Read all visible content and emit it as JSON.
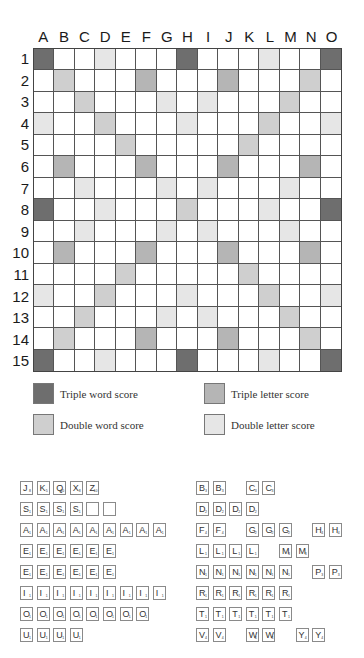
{
  "board": {
    "columns": [
      "A",
      "B",
      "C",
      "D",
      "E",
      "F",
      "G",
      "H",
      "I",
      "J",
      "K",
      "L",
      "M",
      "N",
      "O"
    ],
    "rows": [
      "1",
      "2",
      "3",
      "4",
      "5",
      "6",
      "7",
      "8",
      "9",
      "10",
      "11",
      "12",
      "13",
      "14",
      "15"
    ],
    "layout": [
      [
        "TW",
        "",
        "",
        "DL",
        "",
        "",
        "",
        "TW",
        "",
        "",
        "",
        "DL",
        "",
        "",
        "TW"
      ],
      [
        "",
        "DW",
        "",
        "",
        "",
        "TL",
        "",
        "",
        "",
        "TL",
        "",
        "",
        "",
        "DW",
        ""
      ],
      [
        "",
        "",
        "DW",
        "",
        "",
        "",
        "DL",
        "",
        "DL",
        "",
        "",
        "",
        "DW",
        "",
        ""
      ],
      [
        "DL",
        "",
        "",
        "DW",
        "",
        "",
        "",
        "DL",
        "",
        "",
        "",
        "DW",
        "",
        "",
        "DL"
      ],
      [
        "",
        "",
        "",
        "",
        "DW",
        "",
        "",
        "",
        "",
        "",
        "DW",
        "",
        "",
        "",
        ""
      ],
      [
        "",
        "TL",
        "",
        "",
        "",
        "TL",
        "",
        "",
        "",
        "TL",
        "",
        "",
        "",
        "TL",
        ""
      ],
      [
        "",
        "",
        "DL",
        "",
        "",
        "",
        "DL",
        "",
        "DL",
        "",
        "",
        "",
        "DL",
        "",
        ""
      ],
      [
        "TW",
        "",
        "",
        "DL",
        "",
        "",
        "",
        "DW",
        "",
        "",
        "",
        "DL",
        "",
        "",
        "TW"
      ],
      [
        "",
        "",
        "DL",
        "",
        "",
        "",
        "DL",
        "",
        "DL",
        "",
        "",
        "",
        "DL",
        "",
        ""
      ],
      [
        "",
        "TL",
        "",
        "",
        "",
        "TL",
        "",
        "",
        "",
        "TL",
        "",
        "",
        "",
        "TL",
        ""
      ],
      [
        "",
        "",
        "",
        "",
        "DW",
        "",
        "",
        "",
        "",
        "",
        "DW",
        "",
        "",
        "",
        ""
      ],
      [
        "DL",
        "",
        "",
        "DW",
        "",
        "",
        "",
        "DL",
        "",
        "",
        "",
        "DW",
        "",
        "",
        "DL"
      ],
      [
        "",
        "",
        "DW",
        "",
        "",
        "",
        "DL",
        "",
        "DL",
        "",
        "",
        "",
        "DW",
        "",
        ""
      ],
      [
        "",
        "DW",
        "",
        "",
        "",
        "TL",
        "",
        "",
        "",
        "TL",
        "",
        "",
        "",
        "DW",
        ""
      ],
      [
        "TW",
        "",
        "",
        "DL",
        "",
        "",
        "",
        "TW",
        "",
        "",
        "",
        "DL",
        "",
        "",
        "TW"
      ]
    ],
    "colors": {
      "TW": "#6e6e6e",
      "TL": "#b5b5b5",
      "DW": "#cfcfcf",
      "DL": "#e6e6e6"
    }
  },
  "legend": {
    "triple_word": "Triple word score",
    "triple_letter": "Triple letter score",
    "double_word": "Double word score",
    "double_letter": "Double letter score"
  },
  "tiles": {
    "left": [
      [
        {
          "l": "J",
          "p": "8",
          "s": 0
        },
        {
          "l": "K",
          "p": "5",
          "s": 1
        },
        {
          "l": "Q",
          "p": "10",
          "s": 2
        },
        {
          "l": "X",
          "p": "8",
          "s": 3
        },
        {
          "l": "Z",
          "p": "10",
          "s": 4
        }
      ],
      [
        {
          "l": "S",
          "p": "1",
          "s": 0
        },
        {
          "l": "S",
          "p": "1",
          "s": 1
        },
        {
          "l": "S",
          "p": "1",
          "s": 2
        },
        {
          "l": "S",
          "p": "1",
          "s": 3
        },
        {
          "l": "",
          "p": "",
          "s": 4
        },
        {
          "l": "",
          "p": "",
          "s": 5
        }
      ],
      [
        {
          "l": "A",
          "p": "1",
          "s": 0
        },
        {
          "l": "A",
          "p": "1",
          "s": 1
        },
        {
          "l": "A",
          "p": "1",
          "s": 2
        },
        {
          "l": "A",
          "p": "1",
          "s": 3
        },
        {
          "l": "A",
          "p": "1",
          "s": 4
        },
        {
          "l": "A",
          "p": "1",
          "s": 5
        },
        {
          "l": "A",
          "p": "1",
          "s": 6
        },
        {
          "l": "A",
          "p": "1",
          "s": 7
        },
        {
          "l": "A",
          "p": "1",
          "s": 8
        }
      ],
      [
        {
          "l": "E",
          "p": "1",
          "s": 0
        },
        {
          "l": "E",
          "p": "1",
          "s": 1
        },
        {
          "l": "E",
          "p": "1",
          "s": 2
        },
        {
          "l": "E",
          "p": "1",
          "s": 3
        },
        {
          "l": "E",
          "p": "1",
          "s": 4
        },
        {
          "l": "E",
          "p": "1",
          "s": 5
        }
      ],
      [
        {
          "l": "E",
          "p": "1",
          "s": 0
        },
        {
          "l": "E",
          "p": "1",
          "s": 1
        },
        {
          "l": "E",
          "p": "1",
          "s": 2
        },
        {
          "l": "E",
          "p": "1",
          "s": 3
        },
        {
          "l": "E",
          "p": "1",
          "s": 4
        },
        {
          "l": "E",
          "p": "1",
          "s": 5
        }
      ],
      [
        {
          "l": "I",
          "p": "1",
          "s": 0
        },
        {
          "l": "I",
          "p": "1",
          "s": 1
        },
        {
          "l": "I",
          "p": "1",
          "s": 2
        },
        {
          "l": "I",
          "p": "1",
          "s": 3
        },
        {
          "l": "I",
          "p": "1",
          "s": 4
        },
        {
          "l": "I",
          "p": "1",
          "s": 5
        },
        {
          "l": "I",
          "p": "1",
          "s": 6
        },
        {
          "l": "I",
          "p": "1",
          "s": 7
        },
        {
          "l": "I",
          "p": "1",
          "s": 8
        }
      ],
      [
        {
          "l": "O",
          "p": "1",
          "s": 0
        },
        {
          "l": "O",
          "p": "1",
          "s": 1
        },
        {
          "l": "O",
          "p": "1",
          "s": 2
        },
        {
          "l": "O",
          "p": "1",
          "s": 3
        },
        {
          "l": "O",
          "p": "1",
          "s": 4
        },
        {
          "l": "O",
          "p": "1",
          "s": 5
        },
        {
          "l": "O",
          "p": "1",
          "s": 6
        },
        {
          "l": "O",
          "p": "1",
          "s": 7
        }
      ],
      [
        {
          "l": "U",
          "p": "1",
          "s": 0
        },
        {
          "l": "U",
          "p": "1",
          "s": 1
        },
        {
          "l": "U",
          "p": "1",
          "s": 2
        },
        {
          "l": "U",
          "p": "1",
          "s": 3
        }
      ]
    ],
    "right": [
      [
        {
          "l": "B",
          "p": "3",
          "s": 0
        },
        {
          "l": "B",
          "p": "3",
          "s": 1
        },
        {
          "l": "C",
          "p": "3",
          "s": 3
        },
        {
          "l": "C",
          "p": "3",
          "s": 4
        }
      ],
      [
        {
          "l": "D",
          "p": "2",
          "s": 0
        },
        {
          "l": "D",
          "p": "2",
          "s": 1
        },
        {
          "l": "D",
          "p": "2",
          "s": 2
        },
        {
          "l": "D",
          "p": "2",
          "s": 3
        }
      ],
      [
        {
          "l": "F",
          "p": "4",
          "s": 0
        },
        {
          "l": "F",
          "p": "4",
          "s": 1
        },
        {
          "l": "G",
          "p": "2",
          "s": 3
        },
        {
          "l": "G",
          "p": "2",
          "s": 4
        },
        {
          "l": "G",
          "p": "2",
          "s": 5
        },
        {
          "l": "H",
          "p": "4",
          "s": 7
        },
        {
          "l": "H",
          "p": "4",
          "s": 8
        }
      ],
      [
        {
          "l": "L",
          "p": "1",
          "s": 0
        },
        {
          "l": "L",
          "p": "1",
          "s": 1
        },
        {
          "l": "L",
          "p": "1",
          "s": 2
        },
        {
          "l": "L",
          "p": "1",
          "s": 3
        },
        {
          "l": "M",
          "p": "3",
          "s": 5
        },
        {
          "l": "M",
          "p": "3",
          "s": 6
        }
      ],
      [
        {
          "l": "N",
          "p": "1",
          "s": 0
        },
        {
          "l": "N",
          "p": "1",
          "s": 1
        },
        {
          "l": "N",
          "p": "1",
          "s": 2
        },
        {
          "l": "N",
          "p": "1",
          "s": 3
        },
        {
          "l": "N",
          "p": "1",
          "s": 4
        },
        {
          "l": "N",
          "p": "1",
          "s": 5
        },
        {
          "l": "P",
          "p": "3",
          "s": 7
        },
        {
          "l": "P",
          "p": "3",
          "s": 8
        }
      ],
      [
        {
          "l": "R",
          "p": "1",
          "s": 0
        },
        {
          "l": "R",
          "p": "1",
          "s": 1
        },
        {
          "l": "R",
          "p": "1",
          "s": 2
        },
        {
          "l": "R",
          "p": "1",
          "s": 3
        },
        {
          "l": "R",
          "p": "1",
          "s": 4
        },
        {
          "l": "R",
          "p": "1",
          "s": 5
        }
      ],
      [
        {
          "l": "T",
          "p": "1",
          "s": 0
        },
        {
          "l": "T",
          "p": "1",
          "s": 1
        },
        {
          "l": "T",
          "p": "1",
          "s": 2
        },
        {
          "l": "T",
          "p": "1",
          "s": 3
        },
        {
          "l": "T",
          "p": "1",
          "s": 4
        },
        {
          "l": "T",
          "p": "1",
          "s": 5
        }
      ],
      [
        {
          "l": "V",
          "p": "4",
          "s": 0
        },
        {
          "l": "V",
          "p": "4",
          "s": 1
        },
        {
          "l": "W",
          "p": "4",
          "s": 3
        },
        {
          "l": "W",
          "p": "4",
          "s": 4
        },
        {
          "l": "Y",
          "p": "4",
          "s": 6
        },
        {
          "l": "Y",
          "p": "4",
          "s": 7
        }
      ]
    ]
  }
}
